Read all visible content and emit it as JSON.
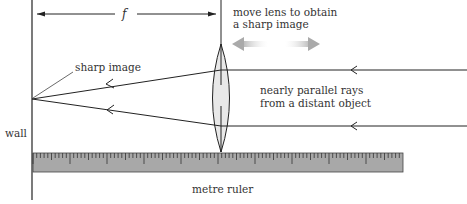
{
  "diagram": {
    "labels": {
      "focal_length": "f",
      "move_lens_line1": "move lens to obtain",
      "move_lens_line2": "a sharp image",
      "sharp_image": "sharp image",
      "rays_line1": "nearly parallel rays",
      "rays_line2": "from a distant object",
      "wall": "wall",
      "ruler": "metre ruler"
    },
    "colors": {
      "line": "#222222",
      "lens_fill": "#e6e6e6",
      "ruler_fill": "#a6a6a6",
      "arrow_gray": "#b0b0b0",
      "text": "#333333"
    },
    "elements": [
      {
        "name": "wall",
        "type": "vertical-line"
      },
      {
        "name": "converging-lens",
        "type": "biconvex-lens"
      },
      {
        "name": "focal-length-dimension",
        "type": "double-arrow",
        "label": "f"
      },
      {
        "name": "upper-ray",
        "type": "ray",
        "direction": "right-to-left"
      },
      {
        "name": "lower-ray",
        "type": "ray",
        "direction": "right-to-left"
      },
      {
        "name": "move-lens-arrow",
        "type": "double-arrow-gray"
      },
      {
        "name": "metre-ruler",
        "type": "ruler",
        "major_ticks": 10
      }
    ]
  }
}
